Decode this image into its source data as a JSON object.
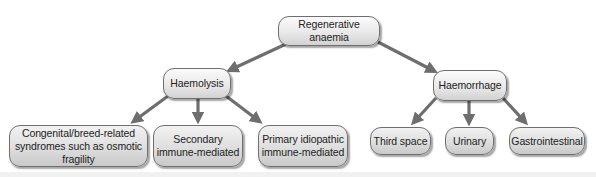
{
  "diagram": {
    "root": {
      "label": "Regenerative anaemia"
    },
    "branches": [
      {
        "label": "Haemolysis",
        "children": [
          {
            "label": "Congenital/breed-related\nsyndromes such as osmotic fragility"
          },
          {
            "label": "Secondary\nimmune-mediated"
          },
          {
            "label": "Primary idiopathic\nimmune-mediated"
          }
        ]
      },
      {
        "label": "Haemorrhage",
        "children": [
          {
            "label": "Third space"
          },
          {
            "label": "Urinary"
          },
          {
            "label": "Gastrointestinal"
          }
        ]
      }
    ],
    "colors": {
      "arrow": "#6e6e6e",
      "node_border": "#6f6f6f",
      "node_fill_top": "#fbfbfb",
      "node_fill_bottom": "#d2d2d2",
      "text": "#222222"
    }
  }
}
